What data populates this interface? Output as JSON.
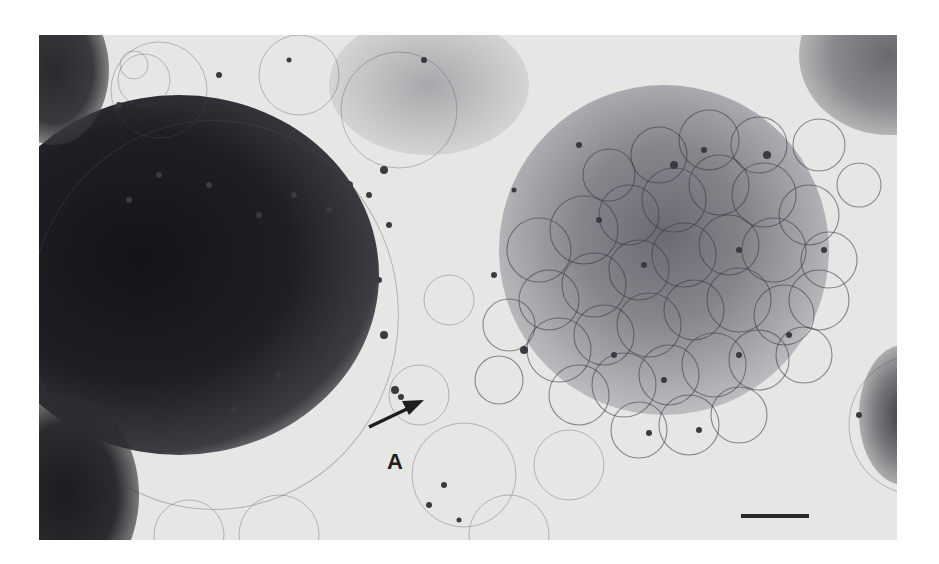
{
  "figure": {
    "type": "transmission-light-micrograph",
    "tone": "grayscale",
    "annotations": [
      {
        "label": "A",
        "kind": "arrow-label",
        "arrow_direction": "up-right"
      }
    ],
    "scale_bar": {
      "present": true,
      "label": ""
    }
  }
}
